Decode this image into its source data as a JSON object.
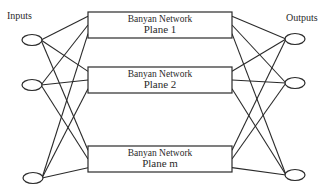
{
  "labels": {
    "inputs": "Inputs",
    "outputs": "Outputs"
  },
  "planes": [
    {
      "title": "Banyan Network",
      "name": "Plane 1",
      "x": 88,
      "y": 12,
      "w": 144,
      "h": 26
    },
    {
      "title": "Banyan Network",
      "name": "Plane 2",
      "x": 88,
      "y": 67,
      "w": 144,
      "h": 26
    },
    {
      "title": "Banyan Network",
      "name": "Plane m",
      "x": 88,
      "y": 146,
      "w": 144,
      "h": 26
    }
  ],
  "inputs": [
    {
      "cx": 32,
      "cy": 40
    },
    {
      "cx": 32,
      "cy": 85
    },
    {
      "cx": 33,
      "cy": 178
    }
  ],
  "outputs": [
    {
      "cx": 295,
      "cy": 39
    },
    {
      "cx": 295,
      "cy": 83
    },
    {
      "cx": 295,
      "cy": 175
    }
  ],
  "colors": {
    "line": "#2a2a2a",
    "background": "#ffffff"
  }
}
